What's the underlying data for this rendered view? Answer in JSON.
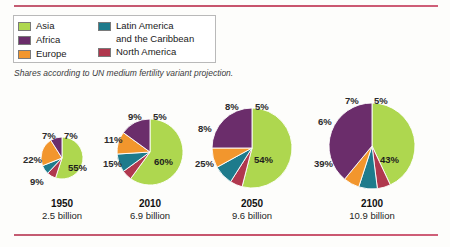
{
  "caption": "Shares according to UN medium fertility variant projection.",
  "legend": {
    "left_column": [
      {
        "label": "Asia",
        "color": "#aed74f",
        "icon": "legend-swatch"
      },
      {
        "label": "Africa",
        "color": "#6b2d6b",
        "icon": "legend-swatch"
      },
      {
        "label": "Europe",
        "color": "#f2962d",
        "icon": "legend-swatch"
      }
    ],
    "right_column": [
      {
        "label": "Latin America\nand the Caribbean",
        "color": "#1e7b8c",
        "icon": "legend-swatch"
      },
      {
        "label": "North America",
        "color": "#b0384e",
        "icon": "legend-swatch"
      }
    ]
  },
  "chart_data": {
    "type": "pie",
    "title": "",
    "subtitle": "Shares according to UN medium fertility variant projection.",
    "legend_position": "top-left",
    "categories": [
      "Asia",
      "Africa",
      "Europe",
      "Latin America and the Caribbean",
      "North America"
    ],
    "colors": [
      "#aed74f",
      "#6b2d6b",
      "#f2962d",
      "#1e7b8c",
      "#b0384e"
    ],
    "pies": [
      {
        "year": "1950",
        "population_label": "2.5 billion",
        "population_billions": 2.5,
        "radius_px": 21,
        "values": [
          55,
          9,
          22,
          7,
          7
        ],
        "labels": [
          "55%",
          "9%",
          "22%",
          "7%",
          "7%"
        ]
      },
      {
        "year": "2010",
        "population_label": "6.9 billion",
        "population_billions": 6.9,
        "radius_px": 33,
        "values": [
          60,
          15,
          11,
          9,
          5
        ],
        "labels": [
          "60%",
          "15%",
          "11%",
          "9%",
          "5%"
        ]
      },
      {
        "year": "2050",
        "population_label": "9.6 billion",
        "population_billions": 9.6,
        "radius_px": 40,
        "values": [
          54,
          25,
          8,
          8,
          5
        ],
        "labels": [
          "54%",
          "25%",
          "8%",
          "8%",
          "5%"
        ]
      },
      {
        "year": "2100",
        "population_label": "10.9 billion",
        "population_billions": 10.9,
        "radius_px": 43,
        "values": [
          43,
          39,
          6,
          7,
          5
        ],
        "labels": [
          "43%",
          "39%",
          "6%",
          "7%",
          "5%"
        ]
      }
    ]
  }
}
